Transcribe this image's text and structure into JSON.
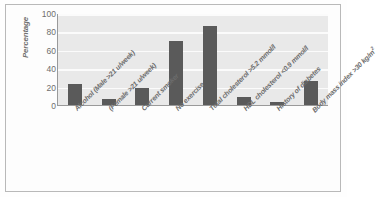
{
  "chart_data": {
    "type": "bar",
    "title": "",
    "xlabel": "",
    "ylabel": "Percentage",
    "ylim": [
      0,
      100
    ],
    "yticks": [
      100,
      80,
      60,
      40,
      20,
      0
    ],
    "grid": true,
    "legend": "none",
    "bar_color": "#5a5a5a",
    "plot_background": "#e9e9e9",
    "gridline_color": "#fbfbfb",
    "categories": [
      "Alcohol  (Male >21 u/week)",
      "(Female >21 u/week)",
      "Current smoker",
      "No exercise",
      "Total cholesterol >5.2 mmol/l",
      "HDL cholesterol <0.9 mmol/l",
      "History of diabetes",
      "Body mass index >30 kg/m"
    ],
    "category_superscripts": [
      "",
      "",
      "",
      "",
      "",
      "",
      "",
      "2"
    ],
    "values": [
      24,
      8,
      20,
      71,
      87,
      10,
      4,
      27
    ]
  }
}
